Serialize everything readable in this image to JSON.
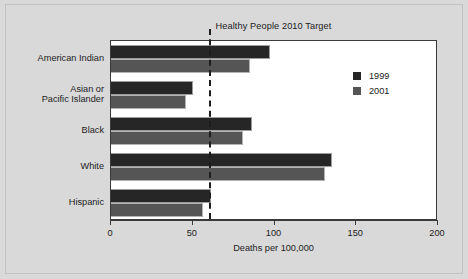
{
  "chart_data": {
    "type": "bar",
    "orientation": "horizontal",
    "title": "Healthy People 2010 Target",
    "xlabel": "Deaths per 100,000",
    "ylabel": "",
    "xlim": [
      0,
      200
    ],
    "xticks": [
      0,
      50,
      100,
      150,
      200
    ],
    "xtick_labels": [
      "0",
      "50",
      "100",
      "150",
      "200"
    ],
    "grid": false,
    "legend_position": "upper right",
    "categories": [
      "American Indian",
      "Asian or Pacific Islander",
      "Black",
      "White",
      "Hispanic"
    ],
    "category_label_lines": [
      [
        "American Indian"
      ],
      [
        "Asian or",
        "Pacific Islander"
      ],
      [
        "Black"
      ],
      [
        "White"
      ],
      [
        "Hispanic"
      ]
    ],
    "series": [
      {
        "name": "1999",
        "color": "#262626",
        "values": [
          97,
          50,
          86,
          135,
          61
        ]
      },
      {
        "name": "2001",
        "color": "#555555",
        "values": [
          85,
          46,
          81,
          131,
          56
        ]
      }
    ],
    "annotations": [
      {
        "name": "healthy-people-2010-target-line",
        "label": "Healthy People 2010 Target",
        "type": "vertical-dashed-line",
        "value": 60
      }
    ]
  },
  "colors": {
    "background": "#d9d9d9",
    "plot_background": "#ffffff",
    "axis": "#3a3a3a",
    "text": "#1b1b1b",
    "series_1999": "#262626",
    "series_2001": "#555555",
    "target_line": "#1d1d1d"
  }
}
